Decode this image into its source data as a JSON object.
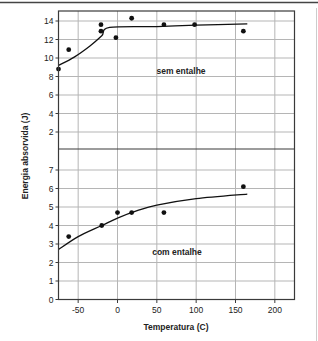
{
  "chart_data": {
    "type": "scatter",
    "title": "",
    "xlabel": "Temperatura (C)",
    "ylabel": "Energia absorvida (J)",
    "xlim": [
      -75,
      225
    ],
    "x_ticks": [
      -50,
      0,
      50,
      100,
      150,
      200
    ],
    "grid": true,
    "panels": [
      {
        "name": "sem entalhe",
        "annotation": "sem entalhe",
        "ylim": [
          0,
          15
        ],
        "y_ticks": [
          2,
          4,
          6,
          8,
          10,
          12,
          14
        ],
        "points": [
          {
            "x": -75,
            "y": 8.8
          },
          {
            "x": -62,
            "y": 10.9
          },
          {
            "x": -21,
            "y": 13.6
          },
          {
            "x": -21,
            "y": 12.9
          },
          {
            "x": -2,
            "y": 12.2
          },
          {
            "x": 18,
            "y": 14.3
          },
          {
            "x": 59,
            "y": 13.6
          },
          {
            "x": 98,
            "y": 13.6
          },
          {
            "x": 160,
            "y": 12.9
          }
        ],
        "fit_curve": [
          {
            "x": -75,
            "y": 9.2
          },
          {
            "x": -55,
            "y": 10.1
          },
          {
            "x": -35,
            "y": 11.3
          },
          {
            "x": -20,
            "y": 12.4
          },
          {
            "x": -10,
            "y": 13.3
          },
          {
            "x": 50,
            "y": 13.4
          },
          {
            "x": 100,
            "y": 13.55
          },
          {
            "x": 165,
            "y": 13.7
          }
        ]
      },
      {
        "name": "com entalhe",
        "annotation": "com entalhe",
        "ylim": [
          0,
          8
        ],
        "y_ticks": [
          0,
          1,
          2,
          3,
          4,
          5,
          6,
          7
        ],
        "points": [
          {
            "x": -62,
            "y": 3.4
          },
          {
            "x": -20,
            "y": 4.0
          },
          {
            "x": 0,
            "y": 4.7
          },
          {
            "x": 18,
            "y": 4.7
          },
          {
            "x": 59,
            "y": 4.7
          },
          {
            "x": 160,
            "y": 6.1
          }
        ],
        "fit_curve": [
          {
            "x": -75,
            "y": 2.7
          },
          {
            "x": -50,
            "y": 3.4
          },
          {
            "x": -20,
            "y": 4.0
          },
          {
            "x": 0,
            "y": 4.4
          },
          {
            "x": 25,
            "y": 4.8
          },
          {
            "x": 50,
            "y": 5.1
          },
          {
            "x": 100,
            "y": 5.45
          },
          {
            "x": 165,
            "y": 5.7
          }
        ]
      }
    ]
  },
  "colors": {
    "frame": "#3a3a3a",
    "grid": "#b5b5b5",
    "points": "#111111",
    "curve": "#111111"
  }
}
